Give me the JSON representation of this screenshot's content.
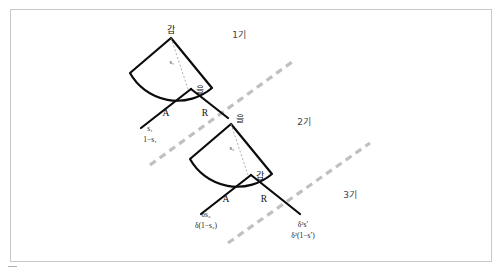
{
  "figure": {
    "type": "game-tree",
    "background_color": "#ffffff",
    "frame_color": "#c8c8c8",
    "edge_color": "#0b0b0b",
    "separator_color": "#c0c0c0"
  },
  "periods": [
    {
      "id": "period-1",
      "label": "1기"
    },
    {
      "id": "period-2",
      "label": "2기"
    },
    {
      "id": "period-3",
      "label": "3기"
    }
  ],
  "trees": [
    {
      "id": "tree-1",
      "proposer_label": "갑",
      "responder_label": "을",
      "offer_variable": "s₁",
      "branches": [
        {
          "id": "accept",
          "label": "A"
        },
        {
          "id": "reject",
          "label": "R"
        }
      ],
      "payoffs": {
        "accept_top": "s₁",
        "accept_bottom": "1−s₁"
      }
    },
    {
      "id": "tree-2",
      "proposer_label": "을",
      "responder_label": "갑",
      "offer_variable": "s₂",
      "branches": [
        {
          "id": "accept",
          "label": "A"
        },
        {
          "id": "reject",
          "label": "R"
        }
      ],
      "payoffs": {
        "accept_top": "δs₂",
        "accept_bottom": "δ(1−s₂)",
        "reject_top": "δ²s′",
        "reject_bottom": "δ²(1−s′)"
      }
    }
  ]
}
